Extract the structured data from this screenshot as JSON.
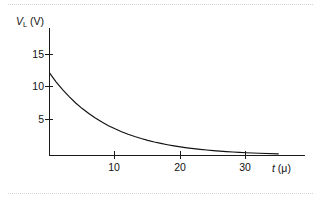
{
  "figure": {
    "background_color": "#ffffff",
    "line_color": "#111111",
    "axis_color": "#1a1a1a",
    "rule_color": "#d2d2d2"
  },
  "axes": {
    "y_title_symbol": "V",
    "y_title_subscript": "L",
    "y_title_unit": "(V)",
    "x_title_symbol": "t",
    "x_title_unit": "(μ)"
  },
  "ticks": {
    "y": [
      {
        "label": "5",
        "value": 5
      },
      {
        "label": "10",
        "value": 10
      },
      {
        "label": "15",
        "value": 15
      }
    ],
    "x": [
      {
        "label": "10",
        "value": 10
      },
      {
        "label": "20",
        "value": 20
      },
      {
        "label": "30",
        "value": 30
      }
    ]
  },
  "chart_data": {
    "type": "line",
    "title": "",
    "subtitle": "",
    "xlabel": "t (μ)",
    "ylabel": "V_L (V)",
    "xlim": [
      0,
      35
    ],
    "ylim": [
      0,
      17.5
    ],
    "xticks": [
      10,
      20,
      30
    ],
    "yticks": [
      5,
      10,
      15
    ],
    "grid": false,
    "legend": null,
    "annotations": [],
    "series": [
      {
        "name": "V_L",
        "description": "Inductor voltage exponential decay V = 12.7 e^(-t/8.8)",
        "initial_value": 12.7,
        "time_constant": 8.8,
        "x": [
          0,
          1,
          2,
          3,
          4,
          5,
          6,
          7,
          8,
          9,
          10,
          11,
          12,
          13,
          14,
          15,
          16,
          17,
          18,
          19,
          20,
          21,
          22,
          23,
          24,
          25,
          26,
          27,
          28,
          29,
          30,
          32,
          35
        ],
        "values": [
          12.7,
          11.34,
          10.13,
          9.05,
          8.08,
          7.22,
          6.45,
          5.76,
          5.14,
          4.59,
          4.1,
          3.66,
          3.27,
          2.92,
          2.61,
          2.33,
          2.08,
          1.86,
          1.66,
          1.48,
          1.32,
          1.18,
          1.06,
          0.94,
          0.84,
          0.75,
          0.67,
          0.6,
          0.54,
          0.48,
          0.43,
          0.34,
          0.24
        ]
      }
    ]
  }
}
